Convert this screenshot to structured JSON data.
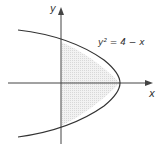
{
  "diagram": {
    "equation": "y² = 4 − x",
    "x_axis_label": "x",
    "y_axis_label": "y",
    "shaded_region": "area between y-axis and parabola",
    "colors": {
      "curve": "#333333",
      "axes": "#444444",
      "shade": "#e6e6e6"
    }
  }
}
